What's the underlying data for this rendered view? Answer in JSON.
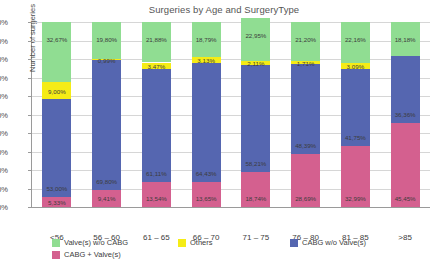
{
  "chart_data": {
    "type": "bar",
    "subtype": "stacked-100-percent",
    "title": "Surgeries by Age and SurgeryType",
    "xlabel": "",
    "ylabel": "Number of surgeries",
    "ylim": [
      0,
      100
    ],
    "y_unit": "%",
    "grid": true,
    "legend_position": "bottom",
    "categories": [
      "<56",
      "56 – 60",
      "61 – 65",
      "66 – 70",
      "71 – 75",
      "76 – 80",
      "81 – 85",
      ">85"
    ],
    "y_ticks": [
      "0%",
      "10%",
      "20%",
      "30%",
      "40%",
      "50%",
      "60%",
      "70%",
      "80%",
      "90%",
      "100%"
    ],
    "series": [
      {
        "name": "CABG + Valve(s)",
        "color": "#d4608f",
        "values": [
          5.33,
          9.41,
          13.54,
          13.65,
          18.74,
          28.69,
          32.99,
          45.45
        ],
        "labels": [
          "5,33%",
          "9,41%",
          "13,54%",
          "13,65%",
          "18,74%",
          "28,69%",
          "32,99%",
          "45,45%"
        ]
      },
      {
        "name": "CABG w/o Valve(s)",
        "color": "#5566b0",
        "values": [
          53.0,
          69.8,
          61.11,
          64.43,
          58.21,
          48.39,
          41.75,
          36.36
        ],
        "labels": [
          "53,00%",
          "69,80%",
          "61,11%",
          "64,43%",
          "58,21%",
          "48,39%",
          "41,75%",
          "36,36%"
        ]
      },
      {
        "name": "Others",
        "color": "#f5ec16",
        "values": [
          9.0,
          0.99,
          3.47,
          3.13,
          2.11,
          1.71,
          3.09,
          0.0
        ],
        "labels": [
          "9,00%",
          "0,99%",
          "3,47%",
          "3,13%",
          "2,11%",
          "1,71%",
          "3,09%",
          ""
        ]
      },
      {
        "name": "Valve(s) w/o CABG",
        "color": "#90dd92",
        "values": [
          32.67,
          19.8,
          21.88,
          18.79,
          22.95,
          21.2,
          22.16,
          18.18
        ],
        "labels": [
          "32,67%",
          "19,80%",
          "21,88%",
          "18,79%",
          "22,95%",
          "21,20%",
          "22,16%",
          "18,18%"
        ]
      }
    ]
  },
  "legend": {
    "items": [
      {
        "label": "Valve(s) w/o CABG",
        "color": "#90dd92"
      },
      {
        "label": "Others",
        "color": "#f5ec16"
      },
      {
        "label": "CABG w/o Valve(s)",
        "color": "#5566b0"
      },
      {
        "label": "CABG + Valve(s)",
        "color": "#d4608f"
      }
    ]
  }
}
